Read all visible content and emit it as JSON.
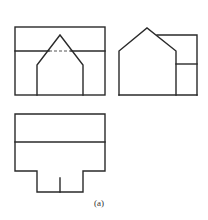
{
  "figure": {
    "caption": "(a)",
    "views": [
      {
        "name": "front-view"
      },
      {
        "name": "side-view"
      },
      {
        "name": "top-view"
      }
    ],
    "line_color": "#2a2a2a"
  }
}
